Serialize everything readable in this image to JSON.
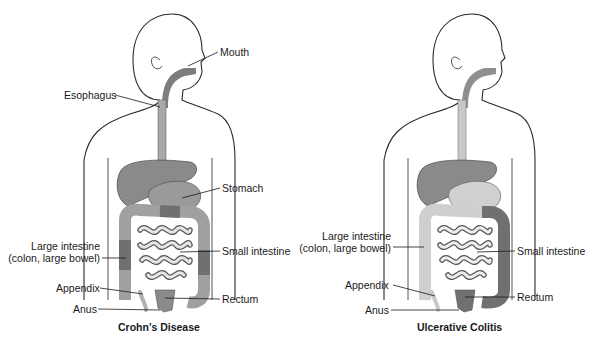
{
  "panels": [
    {
      "id": "crohns",
      "title": "Crohn's Disease",
      "labels": {
        "mouth": "Mouth",
        "esophagus": "Esophagus",
        "stomach": "Stomach",
        "large_intestine_1": "Large intestine",
        "large_intestine_2": "(colon, large bowel)",
        "small_intestine": "Small intestine",
        "appendix": "Appendix",
        "rectum": "Rectum",
        "anus": "Anus"
      },
      "affected_region": "entire digestive tract (mouth to anus), patchy"
    },
    {
      "id": "ulcerative-colitis",
      "title": "Ulcerative Colitis",
      "labels": {
        "large_intestine_1": "Large intestine",
        "large_intestine_2": "(colon, large bowel)",
        "small_intestine": "Small intestine",
        "appendix": "Appendix",
        "rectum": "Rectum",
        "anus": "Anus"
      },
      "affected_region": "colon and rectum, continuous"
    }
  ],
  "colors": {
    "outline": "#2a2a2a",
    "tract_affected": "#7d7d7d",
    "tract_light": "#c8c8c8",
    "organ_dark": "#8a8a8a",
    "organ_light": "#d0d0d0",
    "background": "#ffffff"
  }
}
